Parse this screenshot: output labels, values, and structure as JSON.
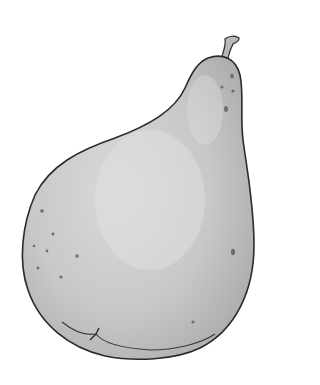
{
  "image": {
    "subject": "Pear illustration",
    "style": "grayscale pencil and watercolor",
    "colors": {
      "background": "#ffffff",
      "body_fill": "#c9c9c9",
      "body_light": "#dcdcdc",
      "body_dark": "#a9a9a9",
      "outline": "#2a2a2a",
      "spots": "#6e6e6e"
    }
  }
}
